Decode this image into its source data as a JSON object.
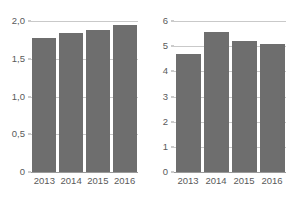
{
  "chart_data": [
    {
      "type": "bar",
      "title": "",
      "xlabel": "",
      "ylabel": "",
      "categories": [
        "2013",
        "2014",
        "2015",
        "2016"
      ],
      "values": [
        1.77,
        1.84,
        1.88,
        1.95
      ],
      "ylim": [
        0,
        2.0
      ],
      "yticks": [
        0,
        0.5,
        1.0,
        1.5,
        2.0
      ],
      "ytick_labels": [
        "0",
        "0,5",
        "1,0",
        "1,5",
        "2,0"
      ],
      "decimal_separator": ",",
      "grid": true,
      "legend": "none",
      "bar_color": "#6e6e6e",
      "gridline_color": "#c9c9c9",
      "axis_color": "#9a9a9a"
    },
    {
      "type": "bar",
      "title": "",
      "xlabel": "",
      "ylabel": "",
      "categories": [
        "2013",
        "2014",
        "2015",
        "2016"
      ],
      "values": [
        4.7,
        5.55,
        5.2,
        5.1
      ],
      "ylim": [
        0,
        6
      ],
      "yticks": [
        0,
        1,
        2,
        3,
        4,
        5,
        6
      ],
      "ytick_labels": [
        "0",
        "1",
        "2",
        "3",
        "4",
        "5",
        "6"
      ],
      "decimal_separator": ",",
      "grid": true,
      "legend": "none",
      "bar_color": "#6e6e6e",
      "gridline_color": "#c9c9c9",
      "axis_color": "#9a9a9a"
    }
  ],
  "panels": [
    {
      "name": "left-bar-chart",
      "ytick_labels": [
        "2,0",
        "1,5",
        "1,0",
        "0,5",
        "0"
      ],
      "xtick_labels": [
        "2013",
        "2014",
        "2015",
        "2016"
      ],
      "bars": [
        {
          "category": "2013",
          "value": "1,77"
        },
        {
          "category": "2014",
          "value": "1,84"
        },
        {
          "category": "2015",
          "value": "1,88"
        },
        {
          "category": "2016",
          "value": "1,95"
        }
      ]
    },
    {
      "name": "right-bar-chart",
      "ytick_labels": [
        "6",
        "5",
        "4",
        "3",
        "2",
        "1",
        "0"
      ],
      "xtick_labels": [
        "2013",
        "2014",
        "2015",
        "2016"
      ],
      "bars": [
        {
          "category": "2013",
          "value": "4,7"
        },
        {
          "category": "2014",
          "value": "5,55"
        },
        {
          "category": "2015",
          "value": "5,2"
        },
        {
          "category": "2016",
          "value": "5,1"
        }
      ]
    }
  ]
}
